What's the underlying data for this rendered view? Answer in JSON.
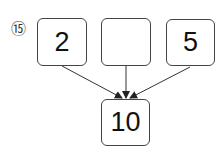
{
  "problem_number": "⑮",
  "top_boxes": [
    "2",
    "",
    "5"
  ],
  "result_box": "10"
}
